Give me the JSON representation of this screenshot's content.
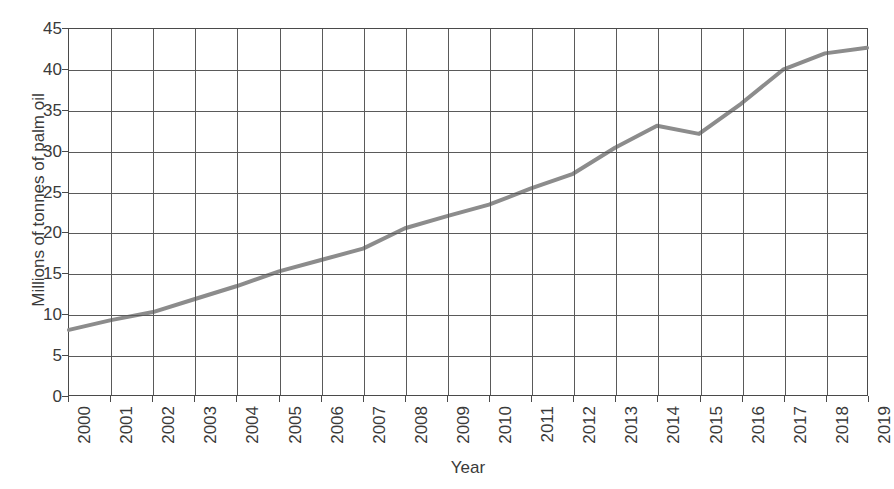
{
  "chart_data": {
    "type": "line",
    "title": "",
    "xlabel": "Year",
    "ylabel": "Millions of tonnes of palm oil",
    "categories": [
      "2000",
      "2001",
      "2002",
      "2003",
      "2004",
      "2005",
      "2006",
      "2007",
      "2008",
      "2009",
      "2010",
      "2011",
      "2012",
      "2013",
      "2014",
      "2015",
      "2016",
      "2017",
      "2018",
      "2019"
    ],
    "values": [
      8.0,
      9.2,
      10.2,
      11.8,
      13.4,
      15.2,
      16.6,
      18.0,
      20.5,
      22.0,
      23.4,
      25.4,
      27.2,
      30.4,
      33.1,
      32.1,
      35.8,
      40.0,
      42.0,
      42.7
    ],
    "series": [
      {
        "name": "Palm oil production",
        "values": [
          8.0,
          9.2,
          10.2,
          11.8,
          13.4,
          15.2,
          16.6,
          18.0,
          20.5,
          22.0,
          23.4,
          25.4,
          27.2,
          30.4,
          33.1,
          32.1,
          35.8,
          40.0,
          42.0,
          42.7
        ]
      }
    ],
    "xlim": [
      2000,
      2019
    ],
    "ylim": [
      0,
      45
    ],
    "y_ticks": [
      0,
      5,
      10,
      15,
      20,
      25,
      30,
      35,
      40,
      45
    ],
    "y_tick_labels": [
      "0",
      "5",
      "10",
      "15",
      "20",
      "25",
      "30",
      "35",
      "40",
      "45"
    ],
    "x_tick_labels": [
      "2000",
      "2001",
      "2002",
      "2003",
      "2004",
      "2005",
      "2006",
      "2007",
      "2008",
      "2009",
      "2010",
      "2011",
      "2012",
      "2013",
      "2014",
      "2015",
      "2016",
      "2017",
      "2018",
      "2019"
    ],
    "grid": true,
    "legend": false,
    "legend_position": "none",
    "line_color": "#8c8c8c",
    "grid_color": "#5a5a5a",
    "axis_color": "#4a4a4a",
    "text_color": "#3a3a3a",
    "line_width": 4,
    "x_tick_label_rotation": 90
  }
}
